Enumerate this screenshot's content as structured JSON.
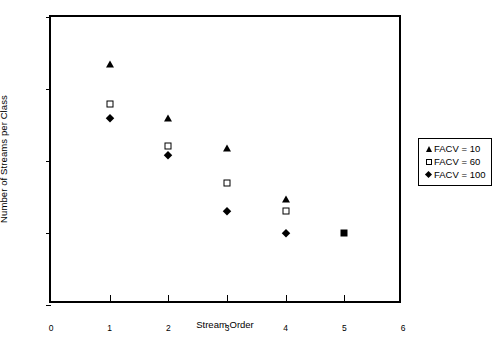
{
  "chart_data": {
    "type": "scatter",
    "title": "",
    "xlabel": "Stream Order",
    "ylabel": "Number of Streams per Class",
    "xlim": [
      0,
      6
    ],
    "ylim": [
      0.1,
      1000
    ],
    "yscale": "log",
    "xscale": "linear",
    "grid": false,
    "legend_position": "right",
    "x_ticks": [
      "0",
      "1",
      "2",
      "3",
      "4",
      "5",
      "6"
    ],
    "y_ticks": [
      "0.1",
      "1",
      "10",
      "100",
      "1000"
    ],
    "x": [
      1,
      2,
      3,
      4,
      5
    ],
    "series": [
      {
        "name": "FACV = 10",
        "marker": "filled-triangle",
        "color": "#000000",
        "values": [
          220,
          40,
          15,
          3,
          1
        ]
      },
      {
        "name": "FACV = 60",
        "marker": "open-square",
        "color": "#000000",
        "values": [
          62,
          16,
          5,
          2,
          1
        ]
      },
      {
        "name": "FACV = 100",
        "marker": "filled-diamond",
        "color": "#000000",
        "values": [
          40,
          12,
          2,
          1,
          1
        ]
      }
    ],
    "annotations": [
      "At Stream Order 5 all three series coincide at a value of 1 and render as one filled square."
    ]
  },
  "axes": {
    "y_title": "Number of Streams per Class",
    "x_title": "Stream Order",
    "y_tick_labels": [
      {
        "label": "1000",
        "value": 1000
      },
      {
        "label": "100",
        "value": 100
      },
      {
        "label": "10",
        "value": 10
      },
      {
        "label": "1",
        "value": 1
      },
      {
        "label": "0.1",
        "value": 0.1
      }
    ],
    "x_tick_labels": [
      {
        "label": "0",
        "value": 0
      },
      {
        "label": "1",
        "value": 1
      },
      {
        "label": "2",
        "value": 2
      },
      {
        "label": "3",
        "value": 3
      },
      {
        "label": "4",
        "value": 4
      },
      {
        "label": "5",
        "value": 5
      },
      {
        "label": "6",
        "value": 6
      }
    ]
  },
  "legend": {
    "entries": [
      {
        "symbol": "filled-triangle",
        "label": "FACV = 10"
      },
      {
        "symbol": "open-square",
        "label": "FACV = 60"
      },
      {
        "symbol": "filled-diamond",
        "label": "FACV = 100"
      }
    ]
  },
  "caption": {
    "text": ""
  },
  "colors": {
    "marker": "#000000",
    "frame": "#000000",
    "background": "#ffffff"
  }
}
